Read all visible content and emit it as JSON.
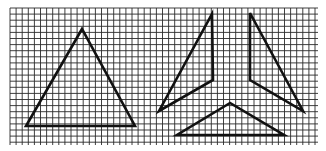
{
  "figure": {
    "background": "#ffffff",
    "grid": {
      "x0": 10,
      "y0": 8,
      "x1": 318,
      "y1": 145,
      "cell": 6.1,
      "color": "#2a2a2a",
      "line_width": 0.9
    },
    "stroke": {
      "color": "#111111",
      "width": 2.6
    },
    "shapes": [
      {
        "name": "equilateral-triangle",
        "points": [
          [
            82,
            29
          ],
          [
            26,
            126
          ],
          [
            135,
            126
          ]
        ]
      },
      {
        "name": "piece-upper-left",
        "points": [
          [
            212,
            14
          ],
          [
            213,
            80
          ],
          [
            159,
            111
          ]
        ]
      },
      {
        "name": "piece-upper-right",
        "points": [
          [
            250,
            13
          ],
          [
            250,
            80
          ],
          [
            303,
            111
          ]
        ]
      },
      {
        "name": "piece-bottom",
        "points": [
          [
            230,
            103
          ],
          [
            177,
            135
          ],
          [
            284,
            135
          ]
        ]
      }
    ]
  }
}
